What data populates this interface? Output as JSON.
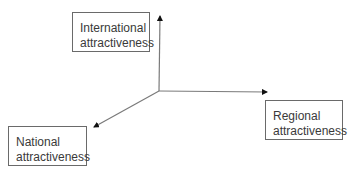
{
  "diagram": {
    "type": "three-axis",
    "origin": {
      "x": 159,
      "y": 91
    },
    "axes": [
      {
        "id": "international",
        "direction": "up",
        "end": {
          "x": 160,
          "y": 15
        }
      },
      {
        "id": "regional",
        "direction": "right",
        "end": {
          "x": 268,
          "y": 92
        }
      },
      {
        "id": "national",
        "direction": "down-left",
        "end": {
          "x": 93,
          "y": 127
        }
      }
    ],
    "nodes": [
      {
        "id": "international",
        "line1": "International",
        "line2": "attractiveness"
      },
      {
        "id": "regional",
        "line1": "Regional",
        "line2": "attractiveness"
      },
      {
        "id": "national",
        "line1": "National",
        "line2": "attractiveness"
      }
    ],
    "colors": {
      "line": "#6a6a6a",
      "arrowhead": "#111111",
      "text": "#3a3a3a",
      "border": "#6a6a6a"
    }
  }
}
